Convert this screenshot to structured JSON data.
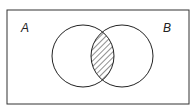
{
  "diagram": {
    "type": "venn",
    "universe": {
      "x": 7,
      "y": 10,
      "width": 182,
      "height": 94
    },
    "sets": [
      {
        "label": "A",
        "cx": 83,
        "cy": 56,
        "r": 31,
        "label_x": 21,
        "label_y": 22
      },
      {
        "label": "B",
        "cx": 122,
        "cy": 56,
        "r": 31,
        "label_x": 163,
        "label_y": 22
      }
    ],
    "shaded_region": "A ∩ B",
    "shading": "diagonal-hatch",
    "stroke_color": "#222222",
    "background_color": "#ffffff"
  }
}
